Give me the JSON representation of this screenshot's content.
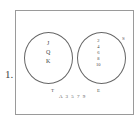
{
  "problem_number": "1.",
  "universe": {
    "label": "S",
    "outside_elements": "A 3 5 7 9"
  },
  "sets": [
    {
      "label": "T",
      "elements": [
        "J",
        "Q",
        "K"
      ]
    },
    {
      "label": "E",
      "elements": [
        "2",
        "4",
        "6",
        "8",
        "10"
      ]
    }
  ]
}
